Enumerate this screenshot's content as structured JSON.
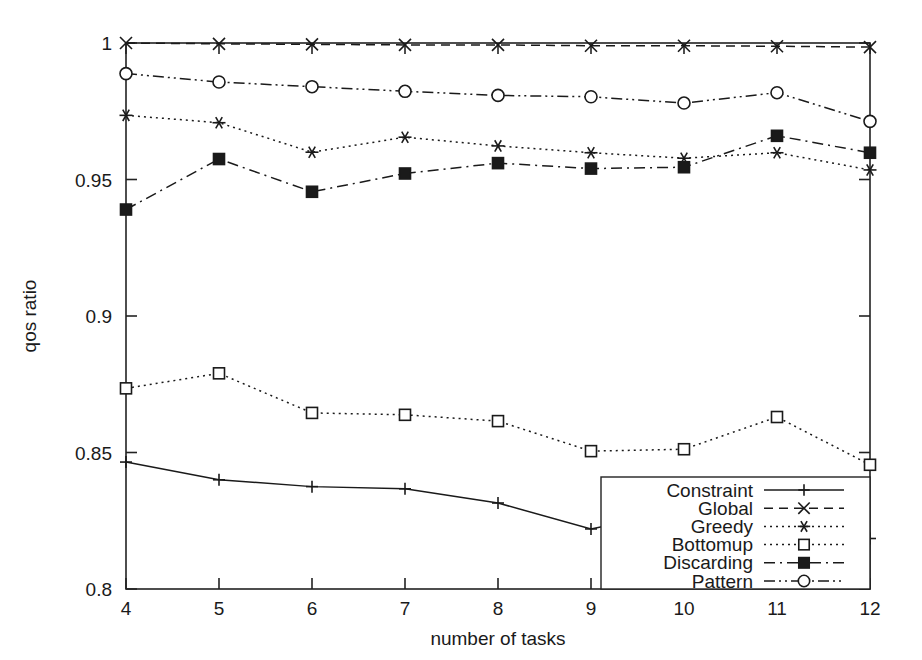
{
  "chart_data": {
    "type": "line",
    "title": "",
    "xlabel": "number of tasks",
    "ylabel": "qos ratio",
    "x": [
      4,
      5,
      6,
      7,
      8,
      9,
      10,
      11,
      12
    ],
    "xlim": [
      4,
      12
    ],
    "ylim": [
      0.8,
      1.0
    ],
    "xticks": [
      "4",
      "5",
      "6",
      "7",
      "8",
      "9",
      "10",
      "11",
      "12"
    ],
    "yticks": [
      "0.8",
      "0.85",
      "0.9",
      "0.95",
      "1"
    ],
    "ytick_values": [
      0.8,
      0.85,
      0.9,
      0.95,
      1.0
    ],
    "grid": false,
    "legend_position": "bottom-right-inside",
    "series": [
      {
        "name": "Constraint",
        "marker": "plus",
        "linestyle": "solid",
        "values": [
          0.8465,
          0.84,
          0.8375,
          0.8367,
          0.8315,
          0.822,
          0.829,
          0.8258,
          0.8185
        ]
      },
      {
        "name": "Global",
        "marker": "cross",
        "linestyle": "dashed",
        "values": [
          1.0,
          0.9997,
          0.9995,
          0.9993,
          0.9993,
          0.999,
          0.999,
          0.9988,
          0.9985
        ]
      },
      {
        "name": "Greedy",
        "marker": "star",
        "linestyle": "dotted",
        "values": [
          0.9735,
          0.9708,
          0.96,
          0.9655,
          0.9623,
          0.9598,
          0.9578,
          0.9598,
          0.9535
        ]
      },
      {
        "name": "Bottomup",
        "marker": "open-square",
        "linestyle": "dotted",
        "values": [
          0.8735,
          0.879,
          0.8645,
          0.8638,
          0.8615,
          0.8505,
          0.8512,
          0.863,
          0.8455
        ]
      },
      {
        "name": "Discarding",
        "marker": "filled-square",
        "linestyle": "dash-dot",
        "values": [
          0.939,
          0.9575,
          0.9455,
          0.9522,
          0.956,
          0.954,
          0.9545,
          0.966,
          0.9598
        ]
      },
      {
        "name": "Pattern",
        "marker": "open-circle",
        "linestyle": "dash-dot-dot",
        "values": [
          0.9888,
          0.9857,
          0.984,
          0.9823,
          0.9808,
          0.9803,
          0.978,
          0.9818,
          0.9713
        ]
      }
    ]
  },
  "axes": {
    "xlabel": "number of tasks",
    "ylabel": "qos ratio"
  },
  "legend": {
    "entries": [
      {
        "label": "Constraint"
      },
      {
        "label": "Global"
      },
      {
        "label": "Greedy"
      },
      {
        "label": "Bottomup"
      },
      {
        "label": "Discarding"
      },
      {
        "label": "Pattern"
      }
    ]
  }
}
